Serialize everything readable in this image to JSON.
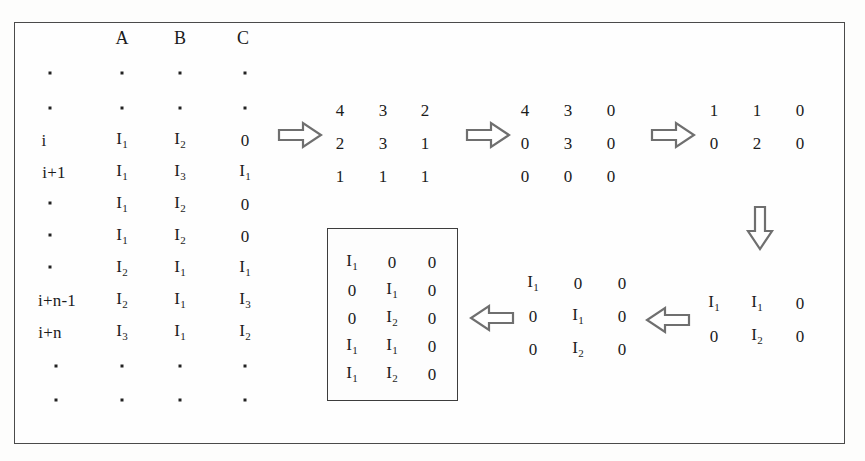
{
  "figure": {
    "kind": "matrix-transformation-diagram",
    "frame_color": "#4a4a4a",
    "text_color": "#1b1b1b"
  },
  "source_table": {
    "name": "source-table",
    "column_headers": [
      "A",
      "B",
      "C"
    ],
    "row_label_header": "",
    "rows": [
      {
        "label": ".",
        "label_is_dot": true,
        "cells": [
          ".",
          ".",
          "."
        ],
        "cells_are_dots": true
      },
      {
        "label": ".",
        "label_is_dot": true,
        "cells": [
          ".",
          ".",
          "."
        ],
        "cells_are_dots": true
      },
      {
        "label": "i",
        "label_is_dot": false,
        "cells": [
          "I1",
          "I2",
          "0"
        ],
        "cells_are_dots": false
      },
      {
        "label": "i+1",
        "label_is_dot": false,
        "cells": [
          "I1",
          "I3",
          "I1"
        ],
        "cells_are_dots": false
      },
      {
        "label": ".",
        "label_is_dot": true,
        "cells": [
          "I1",
          "I2",
          "0"
        ],
        "cells_are_dots": false
      },
      {
        "label": ".",
        "label_is_dot": true,
        "cells": [
          "I1",
          "I2",
          "0"
        ],
        "cells_are_dots": false
      },
      {
        "label": ".",
        "label_is_dot": true,
        "cells": [
          "I2",
          "I1",
          "I1"
        ],
        "cells_are_dots": false
      },
      {
        "label": "i+n-1",
        "label_is_dot": false,
        "cells": [
          "I2",
          "I1",
          "I3"
        ],
        "cells_are_dots": false
      },
      {
        "label": "i+n",
        "label_is_dot": false,
        "cells": [
          "I3",
          "I1",
          "I2"
        ],
        "cells_are_dots": false
      },
      {
        "label": ".",
        "label_is_dot": true,
        "cells": [
          ".",
          ".",
          "."
        ],
        "cells_are_dots": true
      },
      {
        "label": ".",
        "label_is_dot": true,
        "cells": [
          ".",
          ".",
          "."
        ],
        "cells_are_dots": true
      }
    ]
  },
  "matrices": {
    "count_matrix": {
      "name": "count-matrix",
      "rows": [
        [
          "4",
          "3",
          "2"
        ],
        [
          "2",
          "3",
          "1"
        ],
        [
          "1",
          "1",
          "1"
        ]
      ]
    },
    "filtered_matrix": {
      "name": "filtered-matrix",
      "rows": [
        [
          "4",
          "3",
          "0"
        ],
        [
          "0",
          "3",
          "0"
        ],
        [
          "0",
          "0",
          "0"
        ]
      ]
    },
    "reduced_matrix": {
      "name": "reduced-matrix",
      "rows": [
        [
          "1",
          "1",
          "0"
        ],
        [
          "0",
          "2",
          "0"
        ]
      ]
    },
    "symbolic_pair_matrix": {
      "name": "symbolic-pair-matrix",
      "rows": [
        [
          "I1",
          "I1",
          "0"
        ],
        [
          "0",
          "I2",
          "0"
        ]
      ]
    },
    "symbolic_triple_matrix": {
      "name": "symbolic-triple-matrix",
      "rows": [
        [
          "I1",
          "0",
          "0"
        ],
        [
          "0",
          "I1",
          "0"
        ],
        [
          "0",
          "I2",
          "0"
        ]
      ]
    },
    "boxed_result_matrix": {
      "name": "boxed-result-matrix",
      "rows": [
        [
          "I1",
          "0",
          "0"
        ],
        [
          "0",
          "I1",
          "0"
        ],
        [
          "0",
          "I2",
          "0"
        ],
        [
          "I1",
          "I1",
          "0"
        ],
        [
          "I1",
          "I2",
          "0"
        ]
      ]
    }
  },
  "arrows": [
    {
      "name": "arrow-table-to-count-matrix",
      "direction": "right"
    },
    {
      "name": "arrow-count-to-filtered-matrix",
      "direction": "right"
    },
    {
      "name": "arrow-filtered-to-reduced-matrix",
      "direction": "right"
    },
    {
      "name": "arrow-reduced-to-symbolic-pair",
      "direction": "down"
    },
    {
      "name": "arrow-symbolic-pair-to-triple",
      "direction": "left"
    },
    {
      "name": "arrow-triple-to-boxed-result",
      "direction": "left"
    }
  ]
}
